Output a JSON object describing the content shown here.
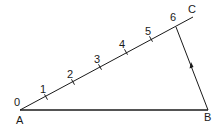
{
  "diagram": {
    "type": "geometric-construction",
    "points": {
      "A": {
        "label": "A",
        "x": 20,
        "y": 110
      },
      "B": {
        "label": "B",
        "x": 208,
        "y": 110
      },
      "C": {
        "label": "C",
        "x": 193,
        "y": 17
      }
    },
    "divisions": [
      {
        "label": "0",
        "x": 20,
        "y": 110
      },
      {
        "label": "1",
        "x": 46,
        "y": 97
      },
      {
        "label": "2",
        "x": 73,
        "y": 82
      },
      {
        "label": "3",
        "x": 100,
        "y": 67
      },
      {
        "label": "4",
        "x": 126,
        "y": 52
      },
      {
        "label": "5",
        "x": 151,
        "y": 39
      },
      {
        "label": "6",
        "x": 176,
        "y": 27
      }
    ],
    "arrow": {
      "on": "B-6",
      "direction": "toward-6"
    },
    "colors": {
      "line": "#1a1a1a",
      "background": "#ffffff"
    }
  }
}
